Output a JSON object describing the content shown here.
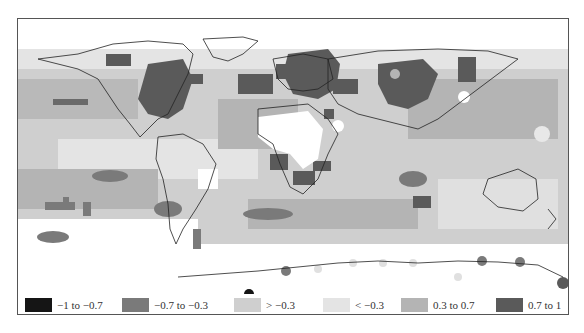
{
  "map": {
    "description": "Global correlation map in grayscale with continental outlines",
    "background": "#ffffff",
    "outline_color": "#222222"
  },
  "legend": {
    "items": [
      {
        "label": "−1 to −0.7",
        "color": "#151515",
        "x": 7
      },
      {
        "label": "−0.7 to −0.3",
        "color": "#7a7a7a",
        "x": 104
      },
      {
        "label": "> −0.3",
        "color": "#cfcfcf",
        "x": 216
      },
      {
        "label": "< −0.3",
        "color": "#e4e4e4",
        "x": 305
      },
      {
        "label": "0.3 to 0.7",
        "color": "#b4b4b4",
        "x": 383
      },
      {
        "label": "0.7 to 1",
        "color": "#5a5a5a",
        "x": 478
      }
    ]
  }
}
